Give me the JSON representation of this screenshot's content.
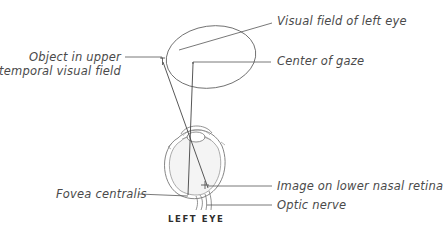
{
  "diagram": {
    "caption": "LEFT EYE",
    "labels": {
      "visual_field": "Visual field of left eye",
      "center_of_gaze": "Center of gaze",
      "object_line1": "Object in upper",
      "object_line2": "temporal visual field",
      "image_on_retina": "Image on lower nasal retina",
      "optic_nerve": "Optic nerve",
      "fovea": "Fovea centralis"
    },
    "colors": {
      "line": "#555555",
      "text": "#4a4a4a",
      "eye_fill": "#f4f4f4"
    }
  }
}
